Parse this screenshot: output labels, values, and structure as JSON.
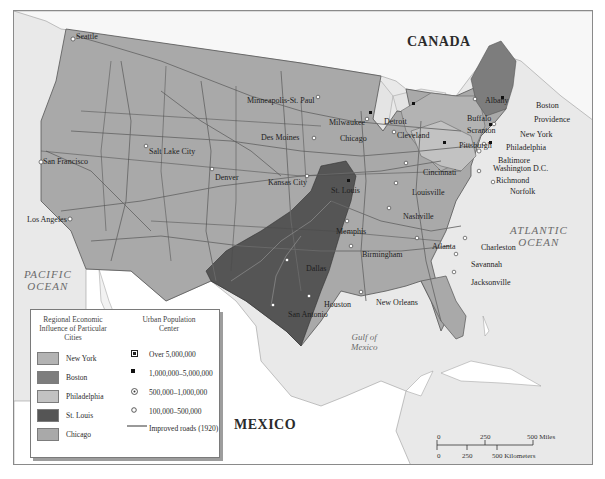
{
  "map": {
    "countries": {
      "canada": "CANADA",
      "mexico": "MEXICO"
    },
    "water": {
      "pacific_line1": "PACIFIC",
      "pacific_line2": "OCEAN",
      "atlantic_line1": "ATLANTIC",
      "atlantic_line2": "OCEAN",
      "gulf_line1": "Gulf of",
      "gulf_line2": "Mexico"
    },
    "cities": [
      {
        "name": "Seattle"
      },
      {
        "name": "San Francisco"
      },
      {
        "name": "Los Angeles"
      },
      {
        "name": "Salt Lake City"
      },
      {
        "name": "Denver"
      },
      {
        "name": "Minneapolis-St. Paul"
      },
      {
        "name": "Des Moines"
      },
      {
        "name": "Kansas City"
      },
      {
        "name": "Milwaukee"
      },
      {
        "name": "Chicago"
      },
      {
        "name": "Detroit"
      },
      {
        "name": "Cleveland"
      },
      {
        "name": "St. Louis"
      },
      {
        "name": "Cincinnati"
      },
      {
        "name": "Louisville"
      },
      {
        "name": "Nashville"
      },
      {
        "name": "Memphis"
      },
      {
        "name": "Birmingham"
      },
      {
        "name": "Atlanta"
      },
      {
        "name": "Dallas"
      },
      {
        "name": "Houston"
      },
      {
        "name": "San Antonio"
      },
      {
        "name": "New Orleans"
      },
      {
        "name": "Charleston"
      },
      {
        "name": "Savannah"
      },
      {
        "name": "Jacksonville"
      },
      {
        "name": "Albany"
      },
      {
        "name": "Boston"
      },
      {
        "name": "Providence"
      },
      {
        "name": "Buffalo"
      },
      {
        "name": "Scranton"
      },
      {
        "name": "New York"
      },
      {
        "name": "Pittsburgh"
      },
      {
        "name": "Philadelphia"
      },
      {
        "name": "Baltimore"
      },
      {
        "name": "Washington D.C."
      },
      {
        "name": "Richmond"
      },
      {
        "name": "Norfolk"
      }
    ],
    "colors": {
      "new_york": "#b3b3b3",
      "boston": "#7d7d7d",
      "philadelphia": "#c2c2c2",
      "st_louis": "#555555",
      "chicago": "#a9a9a9",
      "water": "#e9e9e9",
      "foreign_land": "#ffffff",
      "roads": "#6a6a6a"
    }
  },
  "legend": {
    "region_heading": "Regional Economic Influence of Particular Cities",
    "regions": [
      {
        "label": "New York"
      },
      {
        "label": "Boston"
      },
      {
        "label": "Philadelphia"
      },
      {
        "label": "St. Louis"
      },
      {
        "label": "Chicago"
      }
    ],
    "population_heading": "Urban Population Center",
    "population": [
      {
        "label": "Over 5,000,000",
        "symbol": "square-dot"
      },
      {
        "label": "1,000,000–5,000,000",
        "symbol": "filled-square"
      },
      {
        "label": "500,000–1,000,000",
        "symbol": "circle-dot"
      },
      {
        "label": "100,000–500,000",
        "symbol": "open-circle"
      }
    ],
    "roads_label": "Improved roads (1920)"
  },
  "scale": {
    "miles_ticks": [
      "0",
      "250",
      "500 Miles"
    ],
    "km_ticks": [
      "0",
      "250",
      "500 Kilometers"
    ]
  }
}
